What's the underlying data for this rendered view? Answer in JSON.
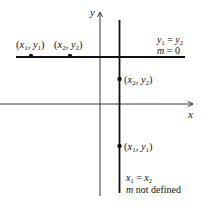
{
  "axes": {
    "x_label": "x",
    "y_label": "y"
  },
  "horizontal_line": {
    "point1": {
      "x": "x",
      "xsub": "1",
      "y": "y",
      "ysub": "1"
    },
    "point2": {
      "x": "x",
      "xsub": "2",
      "y": "y",
      "ysub": "2"
    },
    "equation": {
      "lhs": "y",
      "lhs_sub": "1",
      "op": "=",
      "rhs": "y",
      "rhs_sub": "2"
    },
    "slope": {
      "var": "m",
      "op": "=",
      "value": "0"
    }
  },
  "vertical_line": {
    "point_upper": {
      "x": "x",
      "xsub": "2",
      "y": "y",
      "ysub": "2"
    },
    "point_lower": {
      "x": "x",
      "xsub": "1",
      "y": "y",
      "ysub": "1"
    },
    "equation": {
      "lhs": "x",
      "lhs_sub": "1",
      "op": "=",
      "rhs": "x",
      "rhs_sub": "2"
    },
    "slope": {
      "var": "m",
      "text": "not defined"
    }
  },
  "colors": {
    "ink": "#111111",
    "background": "#ffffff"
  }
}
